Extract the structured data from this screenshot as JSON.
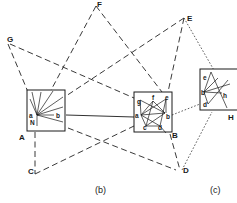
{
  "figure": {
    "captions": {
      "b": "(b)",
      "c": "(c)"
    },
    "outer_nodes": {
      "F": "F",
      "E": "E",
      "G": "G",
      "C": "C",
      "D": "D"
    },
    "boxes": {
      "A": {
        "label": "A",
        "points": {
          "a": "a",
          "b": "b",
          "n": "N"
        }
      },
      "B": {
        "label": "B",
        "points": {
          "a": "a",
          "b": "b",
          "c": "c",
          "d": "d",
          "e": "e",
          "f": "f",
          "g": "g"
        }
      },
      "H": {
        "label": "H",
        "points": {
          "a": "e",
          "b": "b",
          "d": "d",
          "h": "h"
        }
      }
    },
    "edges": {
      "solid": [
        "A-B"
      ],
      "dashed": [
        "G-A",
        "G-B",
        "F-A",
        "F-B",
        "E-A",
        "E-B",
        "C-A",
        "C-B",
        "D-A",
        "D-B"
      ],
      "dotted": [
        "E-H",
        "D-H",
        "B-H"
      ]
    }
  }
}
